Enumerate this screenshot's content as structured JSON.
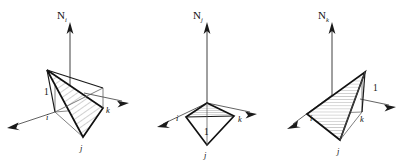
{
  "figure": {
    "background_color": "#ffffff",
    "line_color": "#111111",
    "hatch_color": "#6e6e6e",
    "width": 407,
    "height": 164
  },
  "panels": [
    {
      "id": "panel-i",
      "normal_label_base": "N",
      "normal_label_sub": "i",
      "axis_labels": {
        "left": "i",
        "right": "k",
        "bottom": "j"
      },
      "unit_label": "1",
      "unit_label_position": "left",
      "hatch_direction": "diagonal",
      "description": "Tetrahedron with apex raised above node i; shaded plane slopes from unit height at i down to nodes j and k"
    },
    {
      "id": "panel-j",
      "normal_label_base": "N",
      "normal_label_sub": "j",
      "axis_labels": {
        "left": "i",
        "right": "k",
        "bottom": "j"
      },
      "unit_label": "1",
      "unit_label_position": "center",
      "hatch_direction": "horizontal",
      "description": "Tetrahedron with apex raised above node j; shaded plane forms flattened kite in base plane"
    },
    {
      "id": "panel-k",
      "normal_label_base": "N",
      "normal_label_sub": "k",
      "axis_labels": {
        "left": "i",
        "right": "k",
        "bottom": "j"
      },
      "unit_label": "1",
      "unit_label_position": "right",
      "hatch_direction": "horizontal",
      "description": "Tetrahedron with apex raised above node k; shaded plane slopes from unit height at k down to nodes i and j"
    }
  ],
  "axis_arrow": {
    "name": "arrowhead",
    "count": 9
  }
}
